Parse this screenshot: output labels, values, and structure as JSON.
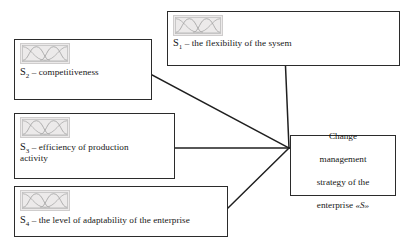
{
  "diagram": {
    "background_color": "#ffffff",
    "line_color": "#1f1f1f",
    "border_color": "#2b2b2b",
    "icon_fill_color": "#eceaea",
    "icon_border_color": "#cfcdcd",
    "icon_name": "fuzzy-membership-function-chart"
  },
  "nodes": {
    "s1": {
      "id": "S1",
      "symbol": "S",
      "index": "1",
      "text": " – the flexibility of the sysem",
      "full_label": "S1 – the flexibility of the sysem"
    },
    "s2": {
      "id": "S2",
      "symbol": "S",
      "index": "2",
      "text": " – competitiveness",
      "full_label": "S2 – competitiveness"
    },
    "s3": {
      "id": "S3",
      "symbol": "S",
      "index": "3",
      "text": " – efficiency of production\nactivity",
      "full_label": "S3 – efficiency of production activity"
    },
    "s4": {
      "id": "S4",
      "symbol": "S",
      "index": "4",
      "text": " – the level of adaptability of the enterprise",
      "full_label": "S4 – the level of adaptability of the enterprise"
    },
    "target": {
      "line1": "Change",
      "line2": "management",
      "line3": "strategy of  the",
      "line4_prefix": "enterprise ",
      "line4_symbol": "«S»",
      "full_label": "Change management strategy of the enterprise «S»"
    }
  },
  "connectors": [
    {
      "from": "s1",
      "to": "target",
      "kind": "vertical-then-join"
    },
    {
      "from": "s2",
      "to": "target",
      "kind": "diagonal-down-right"
    },
    {
      "from": "s3",
      "to": "target",
      "kind": "horizontal"
    },
    {
      "from": "s4",
      "to": "target",
      "kind": "diagonal-up-right"
    }
  ]
}
